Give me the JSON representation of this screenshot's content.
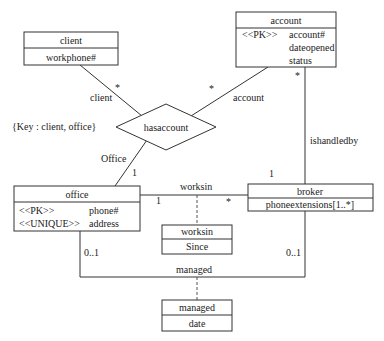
{
  "classes": {
    "client": {
      "name": "client",
      "attrs": [
        "workphone#"
      ]
    },
    "account": {
      "name": "account",
      "stereotype": "<<PK>>",
      "attrs": [
        "account#",
        "dateopened",
        "status"
      ]
    },
    "office": {
      "name": "office",
      "rows": [
        {
          "stereotype": "<<PK>>",
          "attr": "phone#"
        },
        {
          "stereotype": "<<UNIQUE>>",
          "attr": "address"
        }
      ]
    },
    "broker": {
      "name": "broker",
      "attrs": [
        "phoneextensions[1..*]"
      ]
    },
    "worksin": {
      "name": "worksin",
      "attrs": [
        "Since"
      ]
    },
    "managed": {
      "name": "managed",
      "attrs": [
        "date"
      ]
    }
  },
  "relationship": {
    "name": "hasaccount",
    "key_note": "{Key : client, office}"
  },
  "roles": {
    "client": "client",
    "account": "account",
    "office": "Office"
  },
  "associations": {
    "worksin": "worksin",
    "managed": "managed",
    "ishandledby": "ishandledby"
  },
  "multiplicities": {
    "client_star": "*",
    "account_star": "*",
    "office_one": "1",
    "account_broker_star": "*",
    "account_broker_one": "1",
    "worksin_office": "1",
    "worksin_broker": "*",
    "managed_office": "0..1",
    "managed_broker": "0..1"
  }
}
